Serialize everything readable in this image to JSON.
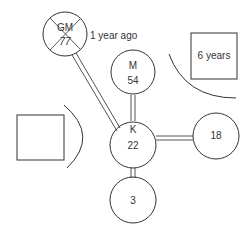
{
  "diagram": {
    "type": "genogram",
    "nodes": [
      {
        "id": "gm",
        "shape": "circle",
        "deceased": true,
        "name": "GM",
        "age": "77",
        "annotation": "1 year ago"
      },
      {
        "id": "m",
        "shape": "circle",
        "name": "M",
        "age": "54"
      },
      {
        "id": "k",
        "shape": "circle",
        "name": "K",
        "age": "22"
      },
      {
        "id": "p18",
        "shape": "circle",
        "name": "",
        "age": "18"
      },
      {
        "id": "c3",
        "shape": "circle",
        "name": "",
        "age": "3"
      },
      {
        "id": "sq-right",
        "shape": "square",
        "label": "6 years"
      },
      {
        "id": "sq-left",
        "shape": "square",
        "label": ""
      }
    ],
    "edges": [
      {
        "from": "gm",
        "to": "k",
        "style": "double"
      },
      {
        "from": "m",
        "to": "k",
        "style": "double"
      },
      {
        "from": "k",
        "to": "p18",
        "style": "double"
      },
      {
        "from": "k",
        "to": "c3",
        "style": "double"
      }
    ],
    "boundaries": [
      {
        "near": "sq-right",
        "style": "arc"
      },
      {
        "near": "sq-left",
        "style": "arc"
      }
    ]
  }
}
